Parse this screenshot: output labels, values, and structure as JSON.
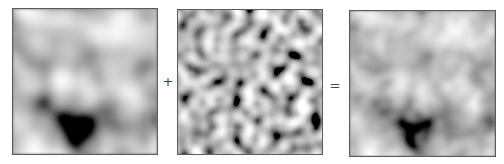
{
  "figure": {
    "panels": [
      {
        "id": "low-frequency-noise",
        "label": "",
        "frequency": "low"
      },
      {
        "id": "high-frequency-noise",
        "label": "",
        "frequency": "high"
      },
      {
        "id": "combined-noise",
        "label": "",
        "frequency": "combined"
      }
    ],
    "operators": {
      "plus": "+",
      "equals": "="
    }
  },
  "colors": {
    "border": "#5a5a5a",
    "background": "#ffffff",
    "operator": "#444444"
  }
}
